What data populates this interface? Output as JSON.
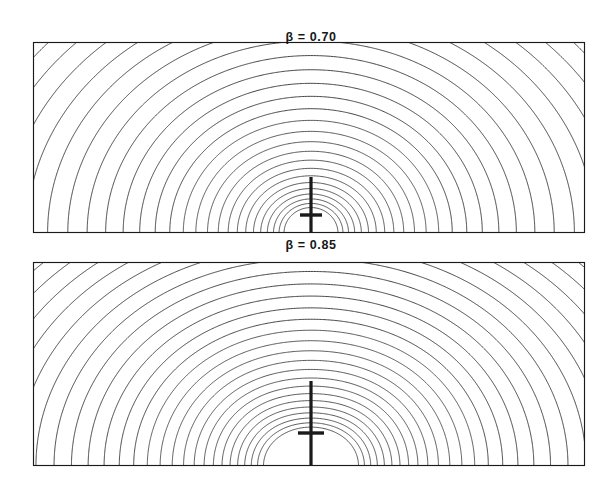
{
  "figure": {
    "type": "contour-plot-figure",
    "background_color": "#ffffff",
    "line_color": "#2b2b2b",
    "frame_color": "#1a1a1a",
    "width": 611,
    "height": 499
  },
  "panels": [
    {
      "id": "panel-top",
      "label": "β = 0.70",
      "beta": 0.7,
      "label_x": 311,
      "label_y": 30,
      "frame": {
        "x": 33,
        "y": 42,
        "width": 552,
        "height": 191
      },
      "source": {
        "type": "vertical-bar-with-crossbar",
        "bar_x": 311,
        "bar_top": 177,
        "bar_bottom": 233,
        "bar_width": 3.2,
        "crossbar_y": 215,
        "crossbar_half_width": 11,
        "crossbar_height": 3.4
      },
      "field": {
        "dipole_strength": 0.7,
        "cusp_depth": 0.34,
        "n_contours": 31,
        "loop_closed": false,
        "top_arc_y": 58
      }
    },
    {
      "id": "panel-bottom",
      "label": "β = 0.85",
      "beta": 0.85,
      "label_x": 311,
      "label_y": 238,
      "frame": {
        "x": 33,
        "y": 262,
        "width": 552,
        "height": 204
      },
      "source": {
        "type": "vertical-bar-with-crossbar",
        "bar_x": 311,
        "bar_top": 381,
        "bar_bottom": 466,
        "bar_width": 3.2,
        "crossbar_y": 433,
        "crossbar_half_width": 13,
        "crossbar_height": 3.4
      },
      "field": {
        "dipole_strength": 0.85,
        "cusp_depth": 0.62,
        "n_contours": 33,
        "loop_closed": true,
        "loop_top_y": 358,
        "top_arc_y": 288
      }
    }
  ],
  "chart_data": {
    "type": "contour",
    "title": "",
    "subtitle": "",
    "xlabel": "",
    "ylabel": "",
    "grid": false,
    "legend": false,
    "panels": [
      {
        "name": "β = 0.70",
        "parameter": "β",
        "value": 0.7,
        "contour_count": 31,
        "levels_normalized": [
          0.02,
          0.05,
          0.08,
          0.11,
          0.145,
          0.18,
          0.215,
          0.25,
          0.29,
          0.33,
          0.37,
          0.41,
          0.45,
          0.49,
          0.53,
          0.57,
          0.61,
          0.645,
          0.68,
          0.715,
          0.75,
          0.78,
          0.81,
          0.84,
          0.865,
          0.89,
          0.912,
          0.932,
          0.95,
          0.967,
          0.982
        ],
        "features": [
          "central singular bar",
          "cusped inner contours",
          "no closed loop"
        ]
      },
      {
        "name": "β = 0.85",
        "parameter": "β",
        "value": 0.85,
        "contour_count": 33,
        "levels_normalized": [
          0.02,
          0.048,
          0.076,
          0.105,
          0.135,
          0.165,
          0.196,
          0.228,
          0.26,
          0.293,
          0.326,
          0.36,
          0.394,
          0.428,
          0.462,
          0.496,
          0.53,
          0.563,
          0.596,
          0.628,
          0.66,
          0.691,
          0.72,
          0.748,
          0.775,
          0.8,
          0.824,
          0.846,
          0.867,
          0.886,
          0.91,
          0.94,
          0.975
        ],
        "features": [
          "central singular bar",
          "closed inner loop above source",
          "separatrix",
          "contours fan to frame edges"
        ]
      }
    ],
    "axis_ranges": {
      "x": [
        -1.0,
        1.0
      ],
      "y": [
        0.0,
        1.0
      ]
    }
  }
}
